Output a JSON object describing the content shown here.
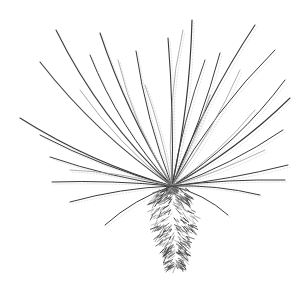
{
  "image": {
    "subject": "Ink line drawing of a spiky desert plant (yucca-like) with radiating thin leaves and a shaggy trunk",
    "width": 308,
    "height": 285,
    "background": "#ffffff",
    "ink_color": "#3a3a3a",
    "light_ink_color": "#9a9a9a",
    "center": [
      172,
      186
    ],
    "leaves": [
      {
        "tip": [
          56,
          30
        ],
        "bend": -18,
        "weight": 1.1,
        "shade": "dark"
      },
      {
        "tip": [
          100,
          33
        ],
        "bend": -10,
        "weight": 1.1,
        "shade": "dark"
      },
      {
        "tip": [
          192,
          20
        ],
        "bend": 8,
        "weight": 1.2,
        "shade": "dark"
      },
      {
        "tip": [
          183,
          30
        ],
        "bend": -12,
        "weight": 0.8,
        "shade": "light"
      },
      {
        "tip": [
          168,
          38
        ],
        "bend": 4,
        "weight": 1.1,
        "shade": "dark"
      },
      {
        "tip": [
          136,
          51
        ],
        "bend": -8,
        "weight": 1.0,
        "shade": "dark"
      },
      {
        "tip": [
          118,
          60
        ],
        "bend": -12,
        "weight": 0.8,
        "shade": "light"
      },
      {
        "tip": [
          255,
          25
        ],
        "bend": -10,
        "weight": 1.1,
        "shade": "dark"
      },
      {
        "tip": [
          275,
          50
        ],
        "bend": -12,
        "weight": 1.0,
        "shade": "dark"
      },
      {
        "tip": [
          220,
          53
        ],
        "bend": 6,
        "weight": 1.0,
        "shade": "dark"
      },
      {
        "tip": [
          240,
          70
        ],
        "bend": 8,
        "weight": 0.8,
        "shade": "light"
      },
      {
        "tip": [
          205,
          60
        ],
        "bend": -6,
        "weight": 0.9,
        "shade": "dark"
      },
      {
        "tip": [
          90,
          55
        ],
        "bend": -14,
        "weight": 1.0,
        "shade": "dark"
      },
      {
        "tip": [
          40,
          62
        ],
        "bend": -14,
        "weight": 1.1,
        "shade": "dark"
      },
      {
        "tip": [
          80,
          90
        ],
        "bend": -10,
        "weight": 0.8,
        "shade": "light"
      },
      {
        "tip": [
          20,
          118
        ],
        "bend": -12,
        "weight": 1.1,
        "shade": "dark"
      },
      {
        "tip": [
          40,
          135
        ],
        "bend": -8,
        "weight": 1.0,
        "shade": "dark"
      },
      {
        "tip": [
          50,
          157
        ],
        "bend": -6,
        "weight": 1.0,
        "shade": "dark"
      },
      {
        "tip": [
          52,
          182
        ],
        "bend": 4,
        "weight": 1.0,
        "shade": "dark"
      },
      {
        "tip": [
          70,
          202
        ],
        "bend": 6,
        "weight": 1.0,
        "shade": "dark"
      },
      {
        "tip": [
          105,
          225
        ],
        "bend": 8,
        "weight": 1.0,
        "shade": "dark"
      },
      {
        "tip": [
          70,
          170
        ],
        "bend": 6,
        "weight": 0.8,
        "shade": "light"
      },
      {
        "tip": [
          145,
          85
        ],
        "bend": 4,
        "weight": 0.8,
        "shade": "light"
      },
      {
        "tip": [
          290,
          98
        ],
        "bend": 10,
        "weight": 1.1,
        "shade": "dark"
      },
      {
        "tip": [
          285,
          80
        ],
        "bend": 14,
        "weight": 1.0,
        "shade": "dark"
      },
      {
        "tip": [
          283,
          130
        ],
        "bend": 8,
        "weight": 1.0,
        "shade": "dark"
      },
      {
        "tip": [
          288,
          165
        ],
        "bend": 4,
        "weight": 1.0,
        "shade": "dark"
      },
      {
        "tip": [
          285,
          180
        ],
        "bend": -4,
        "weight": 1.0,
        "shade": "dark"
      },
      {
        "tip": [
          260,
          195
        ],
        "bend": -6,
        "weight": 1.0,
        "shade": "dark"
      },
      {
        "tip": [
          228,
          215
        ],
        "bend": -8,
        "weight": 1.0,
        "shade": "dark"
      },
      {
        "tip": [
          255,
          110
        ],
        "bend": 8,
        "weight": 0.8,
        "shade": "light"
      },
      {
        "tip": [
          265,
          150
        ],
        "bend": 4,
        "weight": 0.8,
        "shade": "light"
      },
      {
        "tip": [
          210,
          95
        ],
        "bend": 4,
        "weight": 0.8,
        "shade": "light"
      }
    ],
    "trunk": {
      "top": [
        172,
        188
      ],
      "bottom": [
        176,
        268
      ],
      "half_width_top": 14,
      "half_width_mid": 22,
      "half_width_bottom": 6
    }
  }
}
